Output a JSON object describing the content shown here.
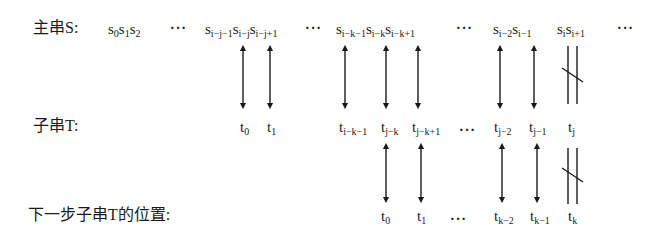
{
  "labels": {
    "main_string": "主串S:",
    "pattern": "子串T:",
    "next_position": "下一步子串T的位置:"
  },
  "row_s": {
    "group1": [
      "s",
      "0",
      "s",
      "1",
      "s",
      "2"
    ],
    "dots1": "···",
    "g2": [
      {
        "base": "s",
        "sub": "i−j−1"
      },
      {
        "base": "s",
        "sub": "i−j"
      },
      {
        "base": "s",
        "sub": "i−j+1"
      }
    ],
    "dots2": "···",
    "g3": [
      {
        "base": "s",
        "sub": "i−k−1"
      },
      {
        "base": "s",
        "sub": "i−k"
      },
      {
        "base": "s",
        "sub": "i−k+1"
      }
    ],
    "dots3": "···",
    "g4": [
      {
        "base": "s",
        "sub": "i−2"
      },
      {
        "base": "s",
        "sub": "i−1"
      }
    ],
    "g5": [
      {
        "base": "s",
        "sub": "i"
      },
      {
        "base": "s",
        "sub": "i+1"
      }
    ],
    "dots4": "···"
  },
  "row_t": {
    "items": [
      {
        "base": "t",
        "sub": "0"
      },
      {
        "base": "t",
        "sub": "1"
      },
      {
        "base": "t",
        "sub": "i−k−1"
      },
      {
        "base": "t",
        "sub": "j−k"
      },
      {
        "base": "t",
        "sub": "j−k+1"
      },
      {
        "base": "t",
        "sub": "j−2"
      },
      {
        "base": "t",
        "sub": "j−1"
      },
      {
        "base": "t",
        "sub": "j"
      }
    ],
    "dots": "···"
  },
  "row_next": {
    "items": [
      {
        "base": "t",
        "sub": "0"
      },
      {
        "base": "t",
        "sub": "1"
      },
      {
        "base": "t",
        "sub": "k−2"
      },
      {
        "base": "t",
        "sub": "k−1"
      },
      {
        "base": "t",
        "sub": "k"
      }
    ],
    "dots": "···"
  },
  "relations": {
    "match_symbol": "double-arrow",
    "mismatch_symbol": "not-equal"
  }
}
